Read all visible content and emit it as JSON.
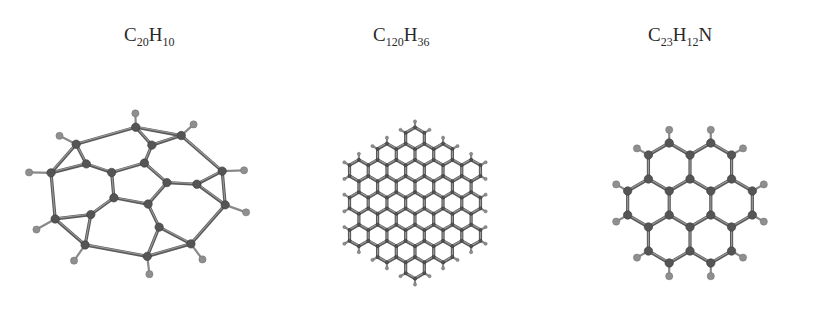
{
  "figure": {
    "molecules": [
      {
        "id": "corannulene",
        "formula": {
          "parts": [
            {
              "t": "C",
              "sub": "20"
            },
            {
              "t": "H",
              "sub": "10"
            }
          ]
        },
        "formula_text": "C20H10",
        "description": "bowl-shaped corannulene ball-and-stick model"
      },
      {
        "id": "graphene-flake",
        "formula": {
          "parts": [
            {
              "t": "C",
              "sub": "120"
            },
            {
              "t": "H",
              "sub": "36"
            }
          ]
        },
        "formula_text": "C120H36",
        "description": "planar hexagonal star-shaped graphene flake model"
      },
      {
        "id": "n-doped-coronene",
        "formula": {
          "parts": [
            {
              "t": "C",
              "sub": "23"
            },
            {
              "t": "H",
              "sub": "12"
            },
            {
              "t": "N",
              "sub": ""
            }
          ]
        },
        "formula_text": "C23H12N",
        "description": "nitrogen-doped coronene-like flake ball-and-stick model"
      }
    ],
    "colors": {
      "carbon": "#555555",
      "hydrogen": "#8f8f8f",
      "nitrogen": "#b5b5b5",
      "bond": "#5a5a5a",
      "background": "#ffffff"
    }
  }
}
